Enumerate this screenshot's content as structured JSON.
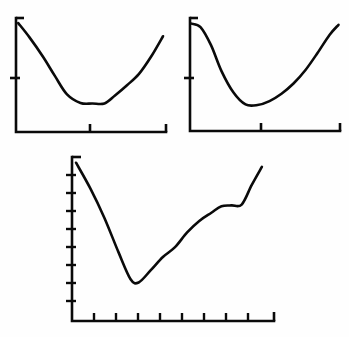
{
  "figure": {
    "background_color": "#fefefe",
    "ink_color": "#0a0a0a",
    "panel_count": 3,
    "width": 349,
    "height": 337
  },
  "chart_data": [
    {
      "type": "line",
      "title": "",
      "xlabel": "",
      "ylabel": "",
      "panel": "top-left",
      "grid": false,
      "legend": null,
      "axis_style": "two-spine (left and bottom), arrow/serif terminals",
      "xlim": [
        0,
        10
      ],
      "ylim": [
        0,
        10
      ],
      "x_ticks": [
        5
      ],
      "y_ticks": [
        4
      ],
      "x_tick_labels": [],
      "y_tick_labels": [],
      "series": [
        {
          "name": "curve-1",
          "description": "steep decline to a flat minimum plateau, then a steady rise",
          "x": [
            0.15,
            0.9,
            1.8,
            2.6,
            3.4,
            4.3,
            5.1,
            5.9,
            6.6,
            7.4,
            8.2,
            9.0,
            9.8
          ],
          "y": [
            9.55,
            8.3,
            6.6,
            4.9,
            3.3,
            2.55,
            2.5,
            2.5,
            3.2,
            4.1,
            5.1,
            6.6,
            8.4
          ]
        }
      ]
    },
    {
      "type": "line",
      "title": "",
      "xlabel": "",
      "ylabel": "",
      "panel": "top-right",
      "grid": false,
      "legend": null,
      "axis_style": "two-spine (left and bottom), arrow/serif terminals",
      "xlim": [
        0,
        10
      ],
      "ylim": [
        0,
        10
      ],
      "x_ticks": [
        5
      ],
      "y_ticks": [
        4
      ],
      "x_tick_labels": [],
      "y_tick_labels": [],
      "series": [
        {
          "name": "curve-2",
          "description": "rounded steep decline to a broad shallow minimum, then an S-shaped rise flattening at the top right",
          "x": [
            0.1,
            0.7,
            1.4,
            2.1,
            2.9,
            3.7,
            4.5,
            5.3,
            6.1,
            6.9,
            7.7,
            8.5,
            9.3,
            9.9
          ],
          "y": [
            9.5,
            9.2,
            7.6,
            5.3,
            3.4,
            2.35,
            2.3,
            2.65,
            3.3,
            4.2,
            5.4,
            6.9,
            8.5,
            9.4
          ]
        }
      ]
    },
    {
      "type": "line",
      "title": "",
      "xlabel": "",
      "ylabel": "",
      "panel": "bottom-center",
      "grid": false,
      "legend": null,
      "axis_style": "two-spine (left and bottom), arrow/serif terminals",
      "xlim": [
        0,
        10
      ],
      "ylim": [
        0,
        10
      ],
      "x_ticks": [
        1,
        2,
        3,
        4,
        5,
        6,
        7,
        8,
        9
      ],
      "y_ticks": [
        1,
        2,
        3,
        4,
        5,
        6,
        7,
        8
      ],
      "x_tick_labels": [],
      "y_tick_labels": [],
      "series": [
        {
          "name": "curve-3",
          "description": "near-linear steep decline to a sharp minimum near x=3, then a rise with a plateau near x=7.5 before a final climb",
          "x": [
            0.2,
            0.9,
            1.6,
            2.3,
            2.9,
            3.3,
            3.9,
            4.5,
            5.1,
            5.7,
            6.3,
            6.9,
            7.4,
            7.9,
            8.4,
            8.9,
            9.4
          ],
          "y": [
            9.65,
            8.1,
            6.3,
            4.2,
            2.55,
            2.35,
            3.1,
            3.9,
            4.5,
            5.4,
            6.1,
            6.6,
            7.0,
            7.05,
            7.1,
            8.3,
            9.4
          ]
        }
      ]
    }
  ]
}
